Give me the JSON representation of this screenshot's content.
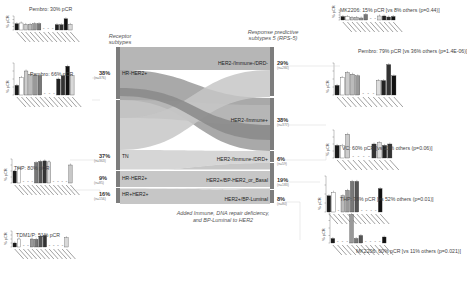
{
  "headers": {
    "left": "Receptor\nsubtypes",
    "right": "Response predictive\nsubtypes 5 (RPS-5)"
  },
  "caption": "Added Immune, DNA repair deficiency,\nand BP-Luminal to HER2",
  "left_nodes": [
    {
      "label": "HR-HER2+",
      "pct": "38%",
      "n": "(n=376)",
      "color": "#8f8f8f"
    },
    {
      "label": "TN",
      "pct": "37%",
      "n": "(n=363)",
      "color": "#c4c4c4"
    },
    {
      "label": "HR-HER2+",
      "pct": "9%",
      "n": "(n=85)",
      "color": "#a8a8a8"
    },
    {
      "label": "HR+HER2+",
      "pct": "16%",
      "n": "(n=156)",
      "color": "#b4b4b4"
    }
  ],
  "right_nodes": [
    {
      "label": "HER2-/Immune-/DRD-",
      "pct": "29%",
      "n": "(n=284)",
      "color": "#a9a9a9"
    },
    {
      "label": "HER2-/Immune+",
      "pct": "38%",
      "n": "(n=377)",
      "color": "#8a8a8a"
    },
    {
      "label": "HER2-/Immune-/DRD+",
      "pct": "6%",
      "n": "(n=59)",
      "color": "#bdbdbd"
    },
    {
      "label": "HER2+/BP-HER2_or_Basal",
      "pct": "19%",
      "n": "(n=183)",
      "color": "#9d9d9d"
    },
    {
      "label": "HER2+/BP-Luminal",
      "pct": "8%",
      "n": "(n=80)",
      "color": "#b0b0b0"
    }
  ],
  "left_panels": [
    {
      "title": "Pembro: 30% pCR",
      "ylabel": "% pCR",
      "values": [
        0.45,
        0.5,
        0.4,
        0.4,
        0.45,
        0.45,
        0,
        0,
        0,
        0.38,
        0.38,
        0.8,
        0.4
      ]
    },
    {
      "title": "Pembro: 66% pCR",
      "ylabel": "% pCR",
      "values": [
        0.3,
        0.55,
        0.75,
        0.65,
        0.62,
        0.6,
        0,
        0,
        0,
        0.5,
        0.6,
        0.9,
        0.6
      ]
    },
    {
      "title": "THP: 80% pCR",
      "ylabel": "% pCR",
      "values": [
        0.5,
        0.65,
        0,
        0,
        0,
        0.85,
        0.9,
        0.92,
        0.88,
        0,
        0,
        0,
        0,
        0.75
      ]
    },
    {
      "title": "TDM1/P: 51% pCR",
      "ylabel": "% pCR",
      "values": [
        0.25,
        0.5,
        0,
        0,
        0.5,
        0.48,
        0.68,
        0.72,
        0,
        0,
        0,
        0,
        0.58
      ]
    }
  ],
  "right_panels": [
    {
      "title": "MK2206: 15% pCR [vs 8% others (p=0.44)]",
      "ylabel": "% pCR",
      "values": [
        0.35,
        0.35,
        0.25,
        0.25,
        0.2,
        0.55,
        0,
        0,
        0.4,
        0.4,
        0.3,
        0.35
      ]
    },
    {
      "title": "Pembro: 79% pCR [vs 36% others (p=1.4E-06)]",
      "ylabel": "% pCR",
      "values": [
        0.3,
        0.55,
        0.7,
        0.65,
        0.6,
        0,
        0,
        0,
        0.45,
        0.45,
        0.95,
        0.6
      ]
    },
    {
      "title": "VC: 60% pCR [vs 31% others (p=0.06)]",
      "ylabel": "% pCR",
      "values": [
        0.45,
        0.45,
        0.85,
        0,
        0,
        0,
        0,
        0.5,
        0.55,
        0.45,
        0.5
      ]
    },
    {
      "title": "THP: 76% pCR [vs 52% others (p=0.01)]",
      "ylabel": "% pCR",
      "values": [
        0.45,
        0.55,
        0,
        0.45,
        0.6,
        0.85,
        0.85,
        0,
        0,
        0,
        0,
        0.65
      ]
    },
    {
      "title": "MK2206: 60% pCR [vs 11% others (p=0.021)]",
      "ylabel": "% pCR",
      "values": [
        0.15,
        0,
        0,
        0,
        0.95,
        0.15,
        0.25,
        0,
        0,
        0,
        0,
        0.2
      ]
    }
  ],
  "bar_colors": [
    "#1a1a1a",
    "#ffffff",
    "#cccccc",
    "#bbbbbb",
    "#999999",
    "#777777",
    "#555555",
    "#333333",
    "#dddddd",
    "#222222",
    "#333333",
    "#111111",
    "#d9d9d9",
    "#c8c8c8"
  ]
}
